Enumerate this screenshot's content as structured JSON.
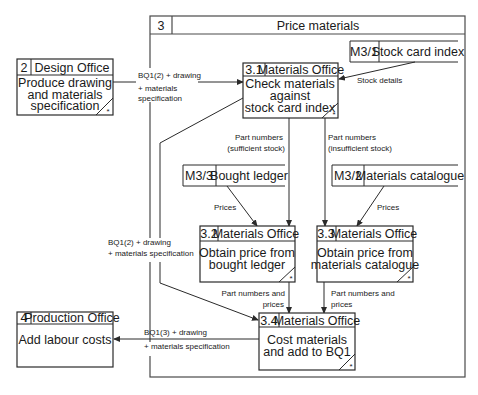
{
  "diagram": {
    "type": "data flow diagram",
    "parent_process": {
      "id": "3",
      "title": "Price materials"
    },
    "processes": [
      {
        "id": "2",
        "location": "Design Office",
        "lines": [
          "Produce drawing",
          "and materials",
          "specification"
        ],
        "marker": "*"
      },
      {
        "id": "3.1",
        "location": "Materials Office",
        "lines": [
          "Check materials",
          "against",
          "stock card index"
        ],
        "marker": "*"
      },
      {
        "id": "3.2",
        "location": "Materials Office",
        "lines": [
          "Obtain price from",
          "bought ledger"
        ],
        "marker": "*"
      },
      {
        "id": "3.3",
        "location": "Materials Office",
        "lines": [
          "Obtain price from",
          "materials catalogue"
        ],
        "marker": "*"
      },
      {
        "id": "3.4",
        "location": "Materials Office",
        "lines": [
          "Cost materials",
          "and add to BQ1"
        ],
        "marker": "*"
      },
      {
        "id": "4",
        "location": "Production Office",
        "lines": [
          "Add labour costs"
        ]
      }
    ],
    "data_stores": [
      {
        "id": "M3/1",
        "name": "Stock card index"
      },
      {
        "id": "M3/3",
        "name": "Bought ledger"
      },
      {
        "id": "M3/2",
        "name": "Materials catalogue"
      }
    ],
    "flows": [
      {
        "from": "2",
        "to": "3.1",
        "lines": [
          "BQ1(2) + drawing",
          "+ materials",
          "specification"
        ]
      },
      {
        "from": "M3/1",
        "to": "3.1",
        "lines": [
          "Stock details"
        ]
      },
      {
        "from": "3.1",
        "to": "3.2",
        "lines": [
          "Part numbers",
          "(sufficient stock)"
        ]
      },
      {
        "from": "3.1",
        "to": "3.3",
        "lines": [
          "Part numbers",
          "(insufficient stock)"
        ]
      },
      {
        "from": "M3/3",
        "to": "3.2",
        "lines": [
          "Prices"
        ]
      },
      {
        "from": "M3/2",
        "to": "3.3",
        "lines": [
          "Prices"
        ]
      },
      {
        "from": "3.1",
        "to": "3.4",
        "lines": [
          "BQ1(2) + drawing",
          "+ materials specification"
        ]
      },
      {
        "from": "3.2",
        "to": "3.4",
        "lines": [
          "Part numbers and",
          "prices"
        ]
      },
      {
        "from": "3.3",
        "to": "3.4",
        "lines": [
          "Part numbers and",
          "prices"
        ]
      },
      {
        "from": "3.4",
        "to": "4",
        "lines": [
          "BQ1(3) + drawing",
          "+ materials specification"
        ]
      }
    ]
  }
}
